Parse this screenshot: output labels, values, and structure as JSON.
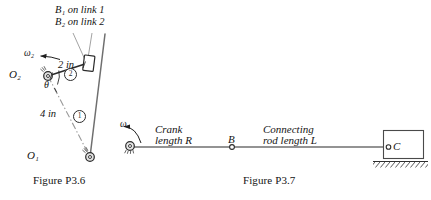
{
  "figures": [
    {
      "id": "figure-p36",
      "caption": "Figure P3.6",
      "labels": {
        "b1_on_link1": "B₁ on link 1",
        "b2_on_link2": "B₂ on link 2",
        "omega2": "ω₂",
        "dim_two_in": "2 in",
        "dim_four_in": "4 in",
        "theta": "θ",
        "pivot_o2": "O₂",
        "pivot_o1": "O₁",
        "link_number_1": "1",
        "link_number_2": "2"
      }
    },
    {
      "id": "figure-p37",
      "caption": "Figure P3.7",
      "labels": {
        "omega": "ω",
        "crank_line1": "Crank",
        "crank_line2": "length R",
        "point_b": "B",
        "rod_line1": "Connecting",
        "rod_line2": "rod length L",
        "point_c": "C"
      }
    }
  ],
  "style": {
    "ink": "#1a1a1a",
    "line": "#3a3a3a",
    "link_gray": "#6f6f6f",
    "paper": "#ffffff"
  }
}
